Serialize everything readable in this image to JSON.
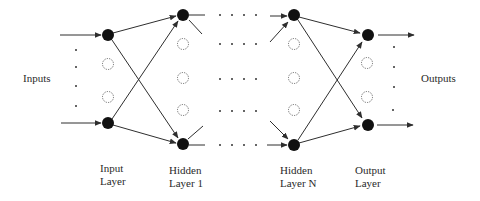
{
  "diagram": {
    "labels": {
      "inputs": "Inputs",
      "outputs": "Outputs",
      "input_layer_line1": "Input",
      "input_layer_line2": "Layer",
      "hidden1_line1": "Hidden",
      "hidden1_line2": "Layer 1",
      "hiddenN_line1": "Hidden",
      "hiddenN_line2": "Layer N",
      "output_layer_line1": "Output",
      "output_layer_line2": "Layer"
    },
    "layers": [
      {
        "name": "Input Layer",
        "x": 108,
        "filled_nodes_y": [
          35,
          123
        ],
        "dashed_nodes_y": [
          64,
          97
        ]
      },
      {
        "name": "Hidden Layer 1",
        "x": 183,
        "filled_nodes_y": [
          15,
          144
        ],
        "dashed_nodes_y": [
          44,
          78,
          110
        ]
      },
      {
        "name": "Hidden Layer N",
        "x": 294,
        "filled_nodes_y": [
          15,
          144
        ],
        "dashed_nodes_y": [
          44,
          78,
          110
        ]
      },
      {
        "name": "Output Layer",
        "x": 367,
        "filled_nodes_y": [
          35,
          125
        ],
        "dashed_nodes_y": [
          63,
          97
        ]
      }
    ],
    "colors": {
      "node_fill": "#111111",
      "edge": "#2e2e2e",
      "text": "#2a2a2a",
      "background": "#ffffff"
    }
  }
}
